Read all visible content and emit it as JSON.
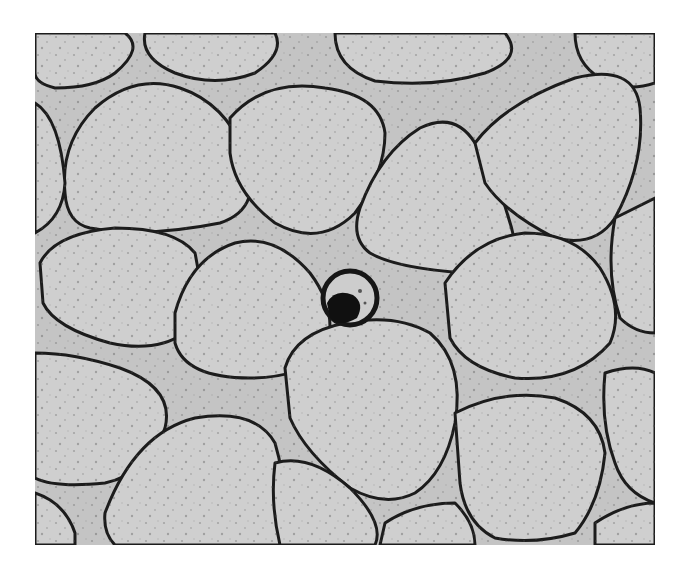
{
  "figure": {
    "background_color": "#c8c8c8",
    "particle_fill": "#d2d2d2",
    "outline_color": "#1a1a1a",
    "frame": {
      "x": 35,
      "y": 33,
      "width": 620,
      "height": 512
    }
  }
}
